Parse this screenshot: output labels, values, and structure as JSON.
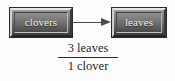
{
  "figure": {
    "type": "flow-diagram",
    "background_color": "#fdfdfd",
    "nodes": [
      {
        "id": "clovers",
        "label": "clovers"
      },
      {
        "id": "leaves",
        "label": "leaves"
      }
    ],
    "connector": {
      "name": "arrow",
      "direction": "right",
      "from": "clovers",
      "to": "leaves",
      "color": "#4b4b4b"
    },
    "ratio": {
      "numerator": "3 leaves",
      "denominator": "1 clover"
    },
    "colors": {
      "node_text": "#f4f4f4",
      "node_fill_light": "#9a9a9a",
      "node_fill_dark": "#3c3c3c",
      "text": "#1f1f1f"
    }
  }
}
